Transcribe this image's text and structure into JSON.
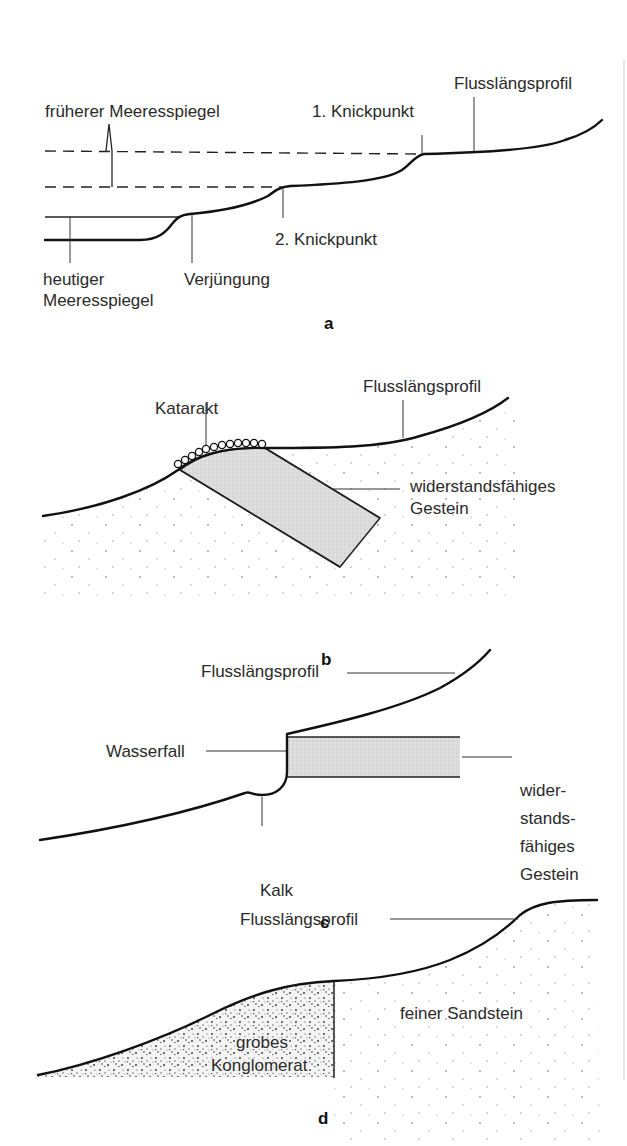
{
  "figure": {
    "colors": {
      "line": "#111111",
      "text": "#2a2a2a",
      "resistant_rock_fill": "#d9d9d9",
      "conglomerate_speckle": "#3a3a3a",
      "sandstone_dots": "#9a9a9a"
    },
    "panel_a": {
      "sublabel": "a",
      "labels": {
        "former_sea_level": "früherer Meeresspiegel",
        "knickpoint_1": "1. Knickpunkt",
        "profile": "Flusslängsprofil",
        "knickpoint_2": "2. Knickpunkt",
        "current_sea_level_line1": "heutiger",
        "current_sea_level_line2": "Meeresspiegel",
        "rejuvenation": "Verjüngung"
      }
    },
    "panel_b": {
      "sublabel": "b",
      "labels": {
        "cataract": "Katarakt",
        "profile": "Flusslängsprofil",
        "resistant_rock_line1": "widerstandsfähiges",
        "resistant_rock_line2": "Gestein"
      }
    },
    "panel_c": {
      "sublabel": "c",
      "labels": {
        "profile": "Flusslängsprofil",
        "waterfall": "Wasserfall",
        "plunge_pool": "Kalk",
        "resistant_rock_line1": "wider-",
        "resistant_rock_line2": "stands-",
        "resistant_rock_line3": "fähiges",
        "resistant_rock_line4": "Gestein"
      }
    },
    "panel_d": {
      "sublabel": "d",
      "labels": {
        "profile": "Flusslängsprofil",
        "conglomerate_line1": "grobes",
        "conglomerate_line2": "Konglomerat",
        "sandstone": "feiner Sandstein"
      }
    }
  }
}
